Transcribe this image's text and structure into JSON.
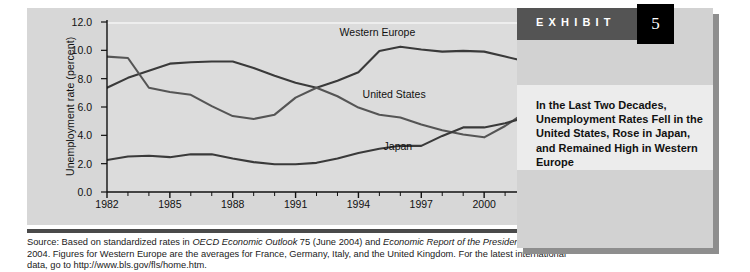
{
  "chart_data": {
    "type": "line",
    "title": "",
    "xlabel": "",
    "ylabel": "Unemployment rate (percent)",
    "xlim": [
      1982,
      2003
    ],
    "ylim": [
      0.0,
      12.0
    ],
    "yticks": [
      "12.0",
      "10.0",
      "8.0",
      "6.0",
      "4.0",
      "2.0",
      "0.0"
    ],
    "ytick_values": [
      12.0,
      10.0,
      8.0,
      6.0,
      4.0,
      2.0,
      0.0
    ],
    "xticks": [
      "1982",
      "1985",
      "1988",
      "1991",
      "1994",
      "1997",
      "2000",
      "2003"
    ],
    "xtick_values": [
      1982,
      1985,
      1988,
      1991,
      1994,
      1997,
      2000,
      2003
    ],
    "minor_xticks_every": 1,
    "grid": false,
    "legend": "inline-labels",
    "x": [
      1982,
      1983,
      1984,
      1985,
      1986,
      1987,
      1988,
      1989,
      1990,
      1991,
      1992,
      1993,
      1994,
      1995,
      1996,
      1997,
      1998,
      1999,
      2000,
      2001,
      2002,
      2003
    ],
    "series": [
      {
        "name": "Western Europe",
        "color": "#3a3a3a",
        "label_x_year": 1993.1,
        "label_y_value": 11.35,
        "values": [
          7.5,
          8.2,
          8.7,
          9.2,
          9.3,
          9.35,
          9.35,
          8.9,
          8.35,
          7.85,
          7.5,
          8.0,
          8.6,
          10.1,
          10.4,
          10.2,
          10.05,
          10.1,
          10.05,
          9.7,
          9.35,
          8.0
        ]
      },
      {
        "name": "United States",
        "color": "#555555",
        "label_x_year": 1994.2,
        "label_y_value": 7.0,
        "values": [
          9.7,
          9.6,
          7.5,
          7.2,
          7.0,
          6.2,
          5.5,
          5.3,
          5.6,
          6.8,
          7.5,
          6.9,
          6.1,
          5.6,
          5.4,
          4.9,
          4.5,
          4.2,
          4.0,
          4.8,
          5.8,
          6.0
        ]
      },
      {
        "name": "Japan",
        "color": "#3a3a3a",
        "label_x_year": 1995.2,
        "label_y_value": 3.35,
        "values": [
          2.4,
          2.65,
          2.7,
          2.6,
          2.8,
          2.8,
          2.5,
          2.25,
          2.1,
          2.1,
          2.2,
          2.5,
          2.9,
          3.2,
          3.4,
          3.4,
          4.1,
          4.7,
          4.7,
          5.0,
          5.4,
          5.3
        ]
      }
    ]
  },
  "exhibit": {
    "word": "EXHIBIT",
    "number": "5",
    "caption": "In the Last Two Decades, Unemployment Rates Fell in the United States, Rose in Japan, and Remained High in Western Europe"
  },
  "source": {
    "prefix": "Source: Based on standardized rates in ",
    "italic1": "OECD Economic Outlook",
    "mid1": " 75 (June 2004) and ",
    "italic2": "Economic Report of the President",
    "mid2": ", February 2004. Figures for Western Europe are the averages for France, Germany, Italy, and the United Kingdom. For the latest international data, go to http://www.bls.gov/fls/home.htm."
  }
}
